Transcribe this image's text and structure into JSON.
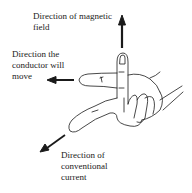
{
  "labels": {
    "magnetic_line1": "Direction of magnetic",
    "magnetic_line2": "field",
    "conductor_line1": "Direction the",
    "conductor_line2": "conductor will",
    "conductor_line3": "move",
    "current_line1": "Direction of",
    "current_line2": "conventional",
    "current_line3": "current"
  },
  "colors": {
    "ink": "#1a1a1a",
    "background": "#ffffff"
  }
}
